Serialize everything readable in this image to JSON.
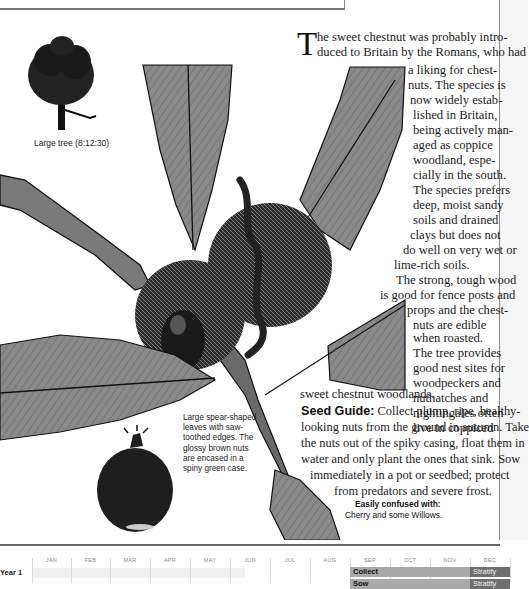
{
  "tree_illustration": {
    "caption": "Large tree (8:12:30)"
  },
  "article": {
    "drop_cap": "T",
    "lines": [
      "he sweet chestnut was probably intro-",
      "duced to Britain by the Romans, who had",
      "a liking for chest-",
      "nuts. The species is",
      "now widely estab-",
      "lished  in Britain,",
      "being actively man-",
      "aged as coppice",
      "woodland, espe-",
      "cially in the south.",
      "The species prefers",
      "deep, moist sandy",
      "soils and drained",
      "clays but does not",
      "do well on very wet or",
      "lime-rich soils.",
      "The strong, tough wood",
      "is good for fence posts and",
      "props and the chest-",
      "nuts are edible",
      "when roasted.",
      "The tree provides",
      "good nest sites for",
      "woodpeckers and",
      "nuthatches and",
      "nightingales often",
      "live in coppiced",
      "sweet chestnut woodlands."
    ]
  },
  "seed_guide": {
    "heading": "Seed Guide:",
    "lines": [
      "Collect plump, ripe, healthy-",
      "looking nuts from the ground in autumn. Take",
      "the nuts out of the spiky casing, float them in",
      "water and only plant the ones that sink. Sow",
      "immediately in a pot or seedbed; protect",
      "from predators and severe frost."
    ]
  },
  "leaf_caption": {
    "lines": [
      "Large spear-shaped",
      "leaves with saw-",
      "toothed edges. The",
      "glossy brown nuts",
      "are encased in a",
      "spiny green case."
    ]
  },
  "confused_with": {
    "title": "Easily confused with:",
    "value": "Cherry and some Willows."
  },
  "calendar": {
    "months": [
      "JAN",
      "FEB",
      "MAR",
      "APR",
      "MAY",
      "JUN",
      "JUL",
      "AUG",
      "SEP",
      "OCT",
      "NOV",
      "DEC"
    ],
    "rows": [
      {
        "label": "Year 1",
        "bars": [
          {
            "label": "Collect",
            "start_month": "SEP",
            "end_month": "NOV",
            "type": "collect"
          },
          {
            "label": "Stratify",
            "start_month": "DEC",
            "end_month": "DEC",
            "type": "stratify"
          }
        ]
      },
      {
        "label": "",
        "bars": [
          {
            "label": "Sow",
            "start_month": "SEP",
            "end_month": "NOV",
            "type": "sow"
          },
          {
            "label": "Stratify",
            "start_month": "DEC",
            "end_month": "DEC",
            "type": "stratify"
          }
        ]
      }
    ],
    "colors": {
      "collect": "#a9a9a9",
      "stratify": "#6f6f6f",
      "header_text": "#888888"
    }
  }
}
